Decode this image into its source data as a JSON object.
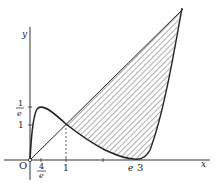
{
  "diagram": {
    "axes": {
      "x_label": "x",
      "y_label": "y",
      "origin_label": "O"
    },
    "x_ticks": [
      {
        "num": "4",
        "den": "e",
        "note": "fraction 4/e"
      },
      {
        "label": "1"
      },
      {
        "label": "e"
      },
      {
        "label": "3"
      }
    ],
    "y_ticks": [
      {
        "num": "1",
        "den": "e",
        "note": "fraction 1/e"
      },
      {
        "label": "1"
      }
    ],
    "curves": [
      {
        "name": "hump-curve",
        "description": "rises from origin to max near 1/e, decreases past intersection at x=1"
      },
      {
        "name": "line-through-origin",
        "description": "straight line from origin through intersection at x=1"
      },
      {
        "name": "steep-curve",
        "description": "touches x-axis near x=e..3, rises steeply to top right"
      }
    ],
    "shaded_region": "hatched region between line and steep curve, from x=1 to top-right intersection"
  }
}
